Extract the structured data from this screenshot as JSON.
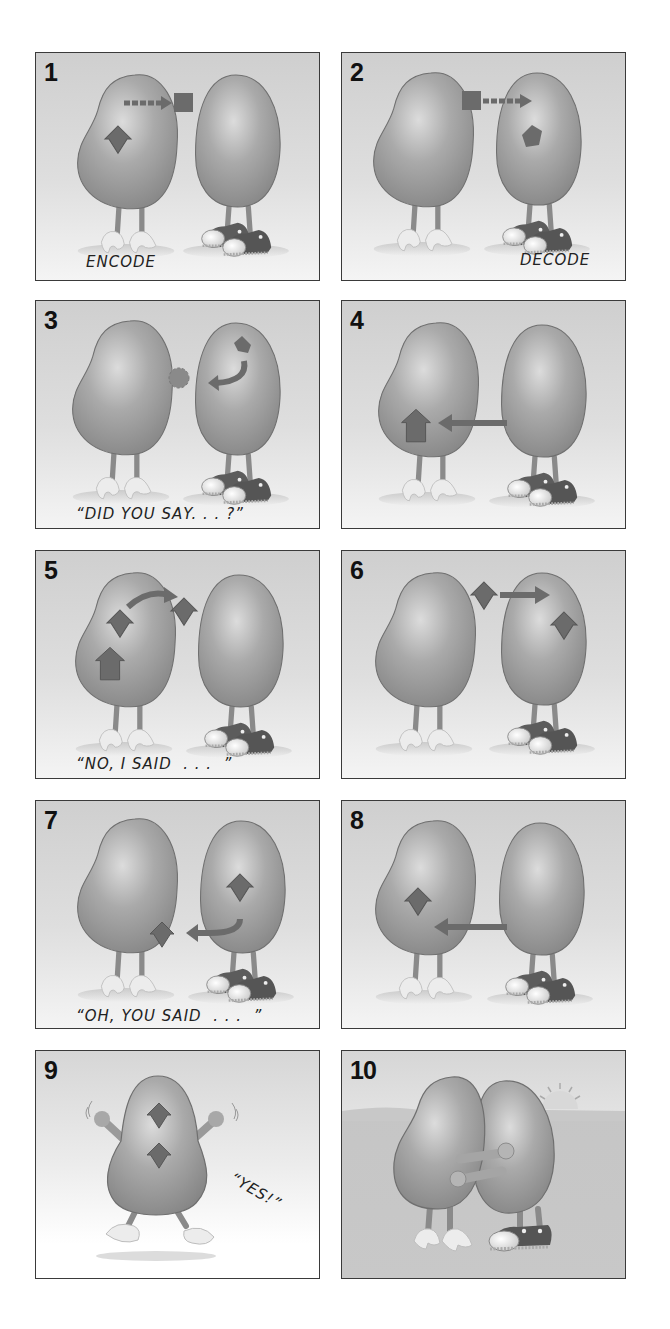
{
  "colors": {
    "border": "#3a3a3a",
    "bean": "#9a9a9a",
    "bean_highlight": "#d2d2d2",
    "bean_outline": "#6f6f6f",
    "symbol": "#6b6b6b",
    "background_top": "#cfcfcf",
    "background_bottom": "#f4f4f4"
  },
  "panels": [
    {
      "number": "1",
      "caption": "ENCODE",
      "scene": "Left bean forms a diamond idea and sends a square message via dashed arrow toward right bean"
    },
    {
      "number": "2",
      "caption": "DECODE",
      "scene": "Square message travels via dashed arrow into right bean, becoming a pentagon shape"
    },
    {
      "number": "3",
      "caption": "“DID YOU SAY. . . ?”",
      "scene": "Fuzzy shape between beans; right bean has a curved arrow feeding back"
    },
    {
      "number": "4",
      "caption": "",
      "scene": "Arrow from right bean points to a house shape inside left bean"
    },
    {
      "number": "5",
      "caption": "“NO, I SAID  . . .  ”",
      "scene": "Left bean has house and diamond shapes; curved arrow sends diamond out"
    },
    {
      "number": "6",
      "caption": "",
      "scene": "Diamond moves via arrow into right bean, which now holds a diamond"
    },
    {
      "number": "7",
      "caption": "“OH, YOU SAID  . . .  ”",
      "scene": "Right bean holds diamond and sends a curved arrow back with a diamond"
    },
    {
      "number": "8",
      "caption": "",
      "scene": "Arrow from right bean to left bean which holds a diamond"
    },
    {
      "number": "9",
      "caption": "“YES!”",
      "scene": "Single bean jumping with arms up holding two diamonds"
    },
    {
      "number": "10",
      "caption": "",
      "scene": "Two beans hugging in front of hills with rising sun"
    }
  ]
}
